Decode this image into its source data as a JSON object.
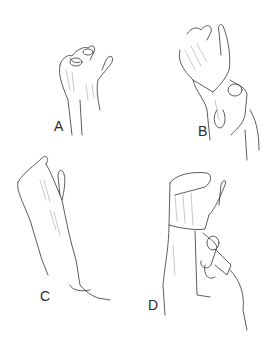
{
  "figure": {
    "panels": [
      {
        "id": "A",
        "label": "A",
        "caption": "Hand with fingertips curled over dressing"
      },
      {
        "id": "B",
        "label": "B",
        "caption": "Bandage roll applied around wrist, held by other hand"
      },
      {
        "id": "C",
        "label": "C",
        "caption": "Forearm and hand raised, fingers flexed"
      },
      {
        "id": "D",
        "label": "D",
        "caption": "Bandage wrapped around hand and wrist with roll held by helper"
      }
    ],
    "colors": {
      "line": "#333333",
      "background": "#ffffff",
      "label": "#2a2a2a"
    }
  }
}
